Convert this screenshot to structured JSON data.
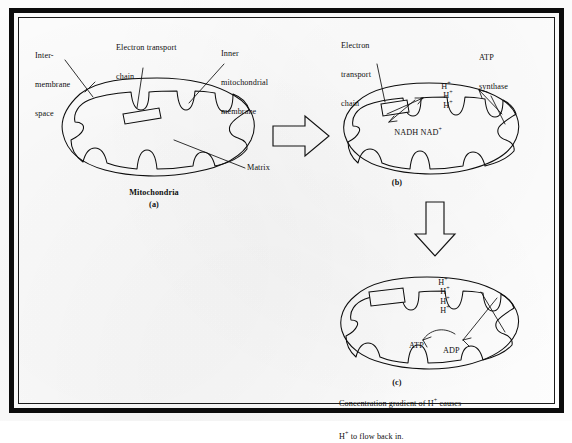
{
  "figure": {
    "title": "Mitochondria",
    "caption": "Concentration gradient of H+ causes H+ to flow back in.",
    "caption_line1_pre": "Concentration gradient of H",
    "caption_line1_sup": "+",
    "caption_line1_post": " causes",
    "caption_line2_pre": "H",
    "caption_line2_sup": "+",
    "caption_line2_post": " to flow back in."
  },
  "panel_a": {
    "id": "(a)",
    "title": "Mitochondria",
    "labels": {
      "intermembrane_line1": "Inter-",
      "intermembrane_line2": "membrane",
      "intermembrane_line3": "space",
      "etc_line1": "Electron transport",
      "etc_line2": "chain",
      "inner_membrane_line1": "Inner",
      "inner_membrane_line2": "mitochondrial",
      "inner_membrane_line3": "membrane",
      "matrix": "Matrix"
    }
  },
  "panel_b": {
    "id": "(b)",
    "labels": {
      "etc_line1": "Electron",
      "etc_line2": "transport",
      "etc_line3": "chain",
      "atp_synthase_line1": "ATP",
      "atp_synthase_line2": "synthase",
      "nadh": "NADH",
      "nad_base": "NAD",
      "nad_sup": "+",
      "proton_base": "H",
      "proton_sup": "+",
      "proton_count": 3
    }
  },
  "panel_c": {
    "id": "(c)",
    "labels": {
      "atp": "ATP",
      "adp": "ADP",
      "proton_base": "H",
      "proton_sup": "+",
      "proton_count": 4
    }
  },
  "flow": {
    "arrow_right": "block-arrow-right",
    "arrow_down": "block-arrow-down"
  },
  "colors": {
    "ink": "#0d0d0d",
    "paper": "#fdfdfd",
    "frame": "#0c0c0c"
  }
}
